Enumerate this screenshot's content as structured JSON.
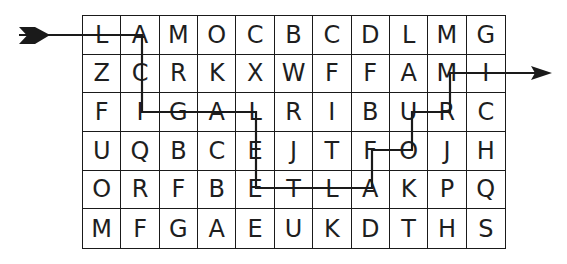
{
  "puzzle": {
    "type": "letter maze / word path",
    "rows": 6,
    "cols": 11,
    "grid": [
      [
        "L",
        "A",
        "M",
        "O",
        "C",
        "B",
        "C",
        "D",
        "L",
        "M",
        "G"
      ],
      [
        "Z",
        "C",
        "R",
        "K",
        "X",
        "W",
        "F",
        "F",
        "A",
        "M",
        "I"
      ],
      [
        "F",
        "I",
        "G",
        "A",
        "L",
        "R",
        "I",
        "B",
        "U",
        "R",
        "C"
      ],
      [
        "U",
        "Q",
        "B",
        "C",
        "E",
        "J",
        "T",
        "F",
        "O",
        "J",
        "H"
      ],
      [
        "O",
        "R",
        "F",
        "B",
        "E",
        "T",
        "L",
        "A",
        "K",
        "P",
        "Q"
      ],
      [
        "M",
        "F",
        "G",
        "A",
        "E",
        "U",
        "K",
        "D",
        "T",
        "H",
        "S"
      ]
    ],
    "path": {
      "entry_arrow": "fletched-tail-left",
      "exit_arrow": "arrowhead-right",
      "stroke_color": "#1a1a1a",
      "points": [
        [
          19,
          35
        ],
        [
          142,
          35
        ],
        [
          142,
          112
        ],
        [
          256,
          112
        ],
        [
          256,
          188
        ],
        [
          372,
          188
        ],
        [
          372,
          150
        ],
        [
          412,
          150
        ],
        [
          412,
          112
        ],
        [
          450,
          112
        ],
        [
          450,
          73
        ],
        [
          540,
          73
        ]
      ]
    },
    "colors": {
      "grid_lines": "#1a1a1a",
      "letters": "#1e1e1e",
      "background": "#ffffff"
    }
  }
}
